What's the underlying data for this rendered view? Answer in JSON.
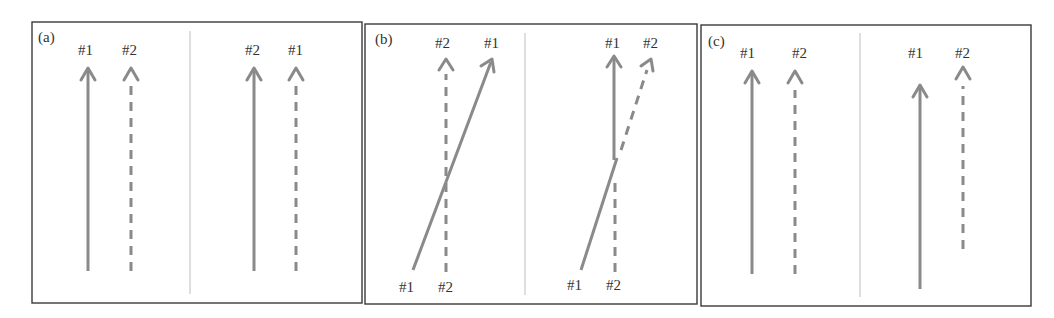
{
  "figure": {
    "panels": [
      {
        "id": "a",
        "label": "(a)",
        "left": {
          "top_labels": [
            "#1",
            "#2"
          ]
        },
        "right": {
          "top_labels": [
            "#2",
            "#1"
          ]
        }
      },
      {
        "id": "b",
        "label": "(b)",
        "left": {
          "top_labels": [
            "#2",
            "#1"
          ],
          "bottom_labels": [
            "#1",
            "#2"
          ]
        },
        "right": {
          "top_labels": [
            "#1",
            "#2"
          ],
          "bottom_labels": [
            "#1",
            "#2"
          ]
        }
      },
      {
        "id": "c",
        "label": "(c)",
        "left": {
          "top_labels": [
            "#1",
            "#2"
          ]
        },
        "right": {
          "top_labels": [
            "#1",
            "#2"
          ]
        }
      }
    ],
    "legend": {
      "solid": "#1",
      "dashed": "#2"
    },
    "colors": {
      "arrow": "#8a8a8a",
      "frame": "#3a3a3a",
      "divider": "#bdbdbd"
    }
  }
}
